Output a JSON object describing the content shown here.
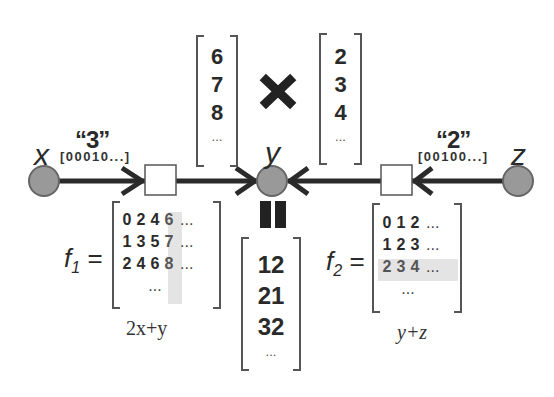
{
  "nodes": {
    "x": {
      "label": "x",
      "color": "#999999"
    },
    "y": {
      "label": "y",
      "color": "#999999"
    },
    "z": {
      "label": "z",
      "color": "#999999"
    }
  },
  "messages": {
    "left": {
      "value_label": "“3”",
      "encoding": "[00010...]"
    },
    "right": {
      "value_label": "“2”",
      "encoding": "[00100...]"
    }
  },
  "vectors": {
    "from_f1": {
      "values": [
        "6",
        "7",
        "8"
      ],
      "ellipsis": "..."
    },
    "from_f2": {
      "values": [
        "2",
        "3",
        "4"
      ],
      "ellipsis": "..."
    },
    "result": {
      "values": [
        "12",
        "21",
        "32"
      ],
      "ellipsis": "..."
    }
  },
  "operators": {
    "multiply": "multiply-x",
    "equals": "equals-bars"
  },
  "factors": {
    "f1": {
      "name": "f",
      "subscript": "1",
      "equals": "=",
      "rows": [
        [
          "0",
          "2",
          "4",
          "6"
        ],
        [
          "1",
          "3",
          "5",
          "7"
        ],
        [
          "2",
          "4",
          "6",
          "8"
        ]
      ],
      "row_ellipsis": "...",
      "bottom_ellipsis": "...",
      "highlight": "column 4",
      "formula": "2x+y"
    },
    "f2": {
      "name": "f",
      "subscript": "2",
      "equals": "=",
      "rows": [
        [
          "0",
          "1",
          "2"
        ],
        [
          "1",
          "2",
          "3"
        ],
        [
          "2",
          "3",
          "4"
        ]
      ],
      "row_ellipsis": "...",
      "bottom_ellipsis": "...",
      "highlight": "row 3",
      "formula": "y+z"
    }
  },
  "colors": {
    "edge": "#2a2a2a",
    "node_fill": "#999999",
    "node_stroke": "#666666",
    "highlight": "#e0e0e0"
  }
}
